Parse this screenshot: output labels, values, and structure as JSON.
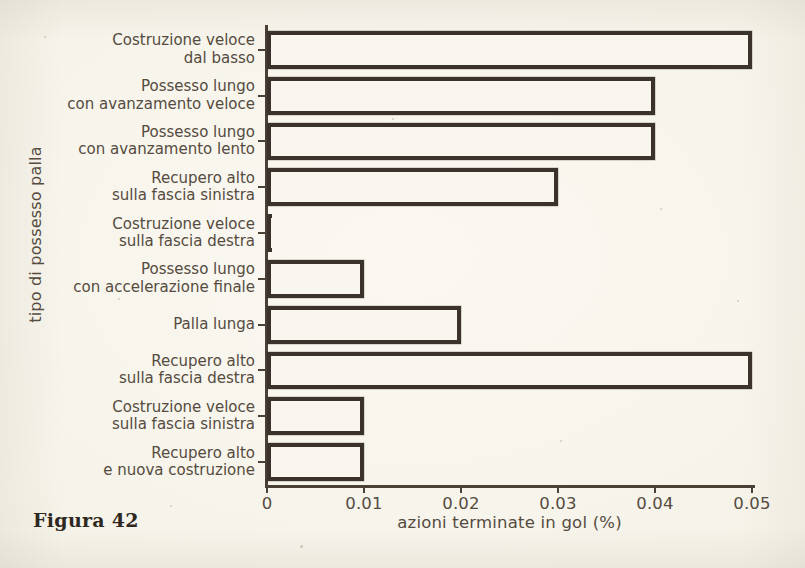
{
  "caption": "Figura 42",
  "chart_data": {
    "type": "bar",
    "orientation": "horizontal",
    "title": "",
    "xlabel": "azioni terminate in gol (%)",
    "ylabel": "tipo di possesso palla",
    "xlim": [
      0,
      0.05
    ],
    "xticks": [
      0,
      0.01,
      0.02,
      0.03,
      0.04,
      0.05
    ],
    "xticklabels": [
      "0",
      "0.01",
      "0.02",
      "0.03",
      "0.04",
      "0.05"
    ],
    "grid": false,
    "legend": null,
    "categories": [
      "Costruzione veloce\ndal basso",
      "Possesso lungo\ncon avanzamento veloce",
      "Possesso lungo\ncon avanzamento lento",
      "Recupero alto\nsulla fascia sinistra",
      "Costruzione veloce\nsulla fascia destra",
      "Possesso lungo\ncon accelerazione finale",
      "Palla lunga",
      "Recupero alto\nsulla fascia destra",
      "Costruzione veloce\nsulla fascia sinistra",
      "Recupero alto\ne nuova costruzione"
    ],
    "values": [
      0.05,
      0.04,
      0.04,
      0.03,
      0.0,
      0.01,
      0.02,
      0.05,
      0.01,
      0.01
    ],
    "bar_edge_color": "#3b332b",
    "bar_face_color": "#f8f6ee",
    "background_color": "#f6f3ea",
    "text_color": "#554b40"
  }
}
